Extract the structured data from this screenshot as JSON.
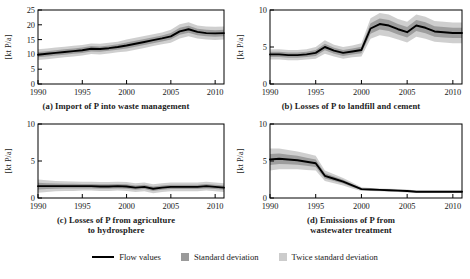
{
  "figure": {
    "ylabel": "[kt P/a]",
    "band_color_1sd": "#9a9a9a",
    "band_color_2sd": "#cccccc",
    "line_color": "#000000"
  },
  "legend": {
    "items": [
      {
        "label": "Flow values",
        "marker": "line",
        "color": "#000000"
      },
      {
        "label": "Standard deviation",
        "marker": "swatch",
        "color": "#9a9a9a"
      },
      {
        "label": "Twice standard deviation",
        "marker": "swatch",
        "color": "#cccccc"
      }
    ]
  },
  "chart_data": [
    {
      "id": "a",
      "type": "line",
      "title": "(a) Import of P into waste management",
      "xlabel": "",
      "ylabel": "[kt P/a]",
      "xlim": [
        1990,
        2011
      ],
      "ylim": [
        0,
        25
      ],
      "xticks": [
        1990,
        1995,
        2000,
        2005,
        2010
      ],
      "yticks": [
        0,
        5,
        10,
        15,
        20,
        25
      ],
      "grid": false,
      "x": [
        1990,
        1991,
        1992,
        1993,
        1994,
        1995,
        1996,
        1997,
        1998,
        1999,
        2000,
        2001,
        2002,
        2003,
        2004,
        2005,
        2006,
        2007,
        2008,
        2009,
        2010,
        2011
      ],
      "series": [
        {
          "name": "Flow values",
          "values": [
            9.9,
            10.2,
            10.5,
            10.8,
            11.1,
            11.4,
            11.9,
            11.8,
            12.1,
            12.5,
            13.0,
            13.6,
            14.2,
            14.8,
            15.4,
            16.1,
            17.8,
            18.5,
            17.6,
            17.2,
            17.1,
            17.2
          ]
        },
        {
          "name": "Standard deviation",
          "values": [
            0.9,
            0.9,
            0.9,
            0.9,
            0.9,
            0.9,
            0.9,
            0.9,
            0.9,
            0.9,
            1.0,
            1.0,
            1.0,
            1.0,
            1.0,
            1.1,
            1.2,
            1.2,
            1.1,
            1.1,
            1.1,
            1.1
          ]
        }
      ]
    },
    {
      "id": "b",
      "type": "line",
      "title": "(b) Losses of P to landfill and cement",
      "xlabel": "",
      "ylabel": "[kt P/a]",
      "xlim": [
        1990,
        2011
      ],
      "ylim": [
        0,
        10
      ],
      "xticks": [
        1990,
        1995,
        2000,
        2005,
        2010
      ],
      "yticks": [
        0,
        5,
        10
      ],
      "grid": false,
      "x": [
        1990,
        1991,
        1992,
        1993,
        1994,
        1995,
        1996,
        1997,
        1998,
        1999,
        2000,
        2001,
        2002,
        2003,
        2004,
        2005,
        2006,
        2007,
        2008,
        2009,
        2010,
        2011
      ],
      "series": [
        {
          "name": "Flow values",
          "values": [
            4.0,
            4.0,
            3.9,
            3.9,
            4.0,
            4.2,
            5.0,
            4.5,
            4.2,
            4.4,
            4.6,
            7.5,
            8.1,
            7.9,
            7.4,
            7.0,
            7.9,
            7.6,
            7.1,
            7.0,
            6.9,
            6.9
          ]
        },
        {
          "name": "Standard deviation",
          "values": [
            0.35,
            0.35,
            0.35,
            0.35,
            0.35,
            0.4,
            0.45,
            0.4,
            0.4,
            0.4,
            0.45,
            0.7,
            0.75,
            0.75,
            0.7,
            0.7,
            0.75,
            0.75,
            0.7,
            0.7,
            0.7,
            0.7
          ]
        }
      ]
    },
    {
      "id": "c",
      "type": "line",
      "title": "(c) Losses of P from agriculture to hydrosphere",
      "title_line1": "(c) Losses of P from agriculture",
      "title_line2": "to hydrosphere",
      "xlabel": "",
      "ylabel": "[kt P/a]",
      "xlim": [
        1990,
        2011
      ],
      "ylim": [
        0,
        10
      ],
      "xticks": [
        1990,
        1995,
        2000,
        2005,
        2010
      ],
      "yticks": [
        0,
        5,
        10
      ],
      "grid": false,
      "x": [
        1990,
        1991,
        1992,
        1993,
        1994,
        1995,
        1996,
        1997,
        1998,
        1999,
        2000,
        2001,
        2002,
        2003,
        2004,
        2005,
        2006,
        2007,
        2008,
        2009,
        2010,
        2011
      ],
      "series": [
        {
          "name": "Flow values",
          "values": [
            1.6,
            1.6,
            1.6,
            1.6,
            1.6,
            1.6,
            1.6,
            1.55,
            1.55,
            1.6,
            1.55,
            1.4,
            1.5,
            1.25,
            1.4,
            1.5,
            1.5,
            1.5,
            1.5,
            1.6,
            1.5,
            1.4
          ]
        },
        {
          "name": "Standard deviation",
          "values": [
            0.45,
            0.4,
            0.35,
            0.33,
            0.32,
            0.3,
            0.3,
            0.3,
            0.3,
            0.3,
            0.3,
            0.3,
            0.3,
            0.3,
            0.3,
            0.3,
            0.3,
            0.3,
            0.3,
            0.3,
            0.3,
            0.3
          ]
        }
      ]
    },
    {
      "id": "d",
      "type": "line",
      "title": "(d) Emissions of P from wastewater treatment",
      "title_line1": "(d) Emissions of P from",
      "title_line2": "wastewater treatment",
      "xlabel": "",
      "ylabel": "[kt P/a]",
      "xlim": [
        1990,
        2011
      ],
      "ylim": [
        0,
        10
      ],
      "xticks": [
        1990,
        1995,
        2000,
        2005,
        2010
      ],
      "yticks": [
        0,
        5,
        10
      ],
      "grid": false,
      "x": [
        1990,
        1991,
        1992,
        1993,
        1994,
        1995,
        1996,
        1997,
        1998,
        1999,
        2000,
        2001,
        2002,
        2003,
        2004,
        2005,
        2006,
        2007,
        2008,
        2009,
        2010,
        2011
      ],
      "series": [
        {
          "name": "Flow values",
          "values": [
            5.2,
            5.3,
            5.2,
            5.1,
            4.9,
            4.7,
            3.0,
            2.6,
            2.2,
            1.7,
            1.2,
            1.15,
            1.1,
            1.05,
            1.0,
            0.95,
            0.85,
            0.85,
            0.85,
            0.85,
            0.85,
            0.85
          ]
        },
        {
          "name": "Standard deviation",
          "values": [
            0.75,
            0.7,
            0.65,
            0.6,
            0.55,
            0.5,
            0.35,
            0.3,
            0.25,
            0.2,
            0.12,
            0.1,
            0.1,
            0.1,
            0.1,
            0.1,
            0.08,
            0.08,
            0.08,
            0.08,
            0.08,
            0.08
          ]
        }
      ]
    }
  ]
}
